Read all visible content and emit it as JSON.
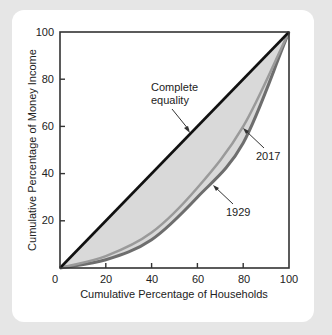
{
  "chart_data": {
    "type": "line",
    "title": "",
    "xlabel": "Cumulative Percentage of Households",
    "ylabel": "Cumulative Percentage of Money Income",
    "xlim": [
      0,
      100
    ],
    "ylim": [
      0,
      100
    ],
    "x_ticks": [
      0,
      20,
      40,
      60,
      80,
      100
    ],
    "y_ticks": [
      20,
      40,
      60,
      80,
      100
    ],
    "x_tick_labels": [
      "0",
      "20",
      "40",
      "60",
      "80",
      "100"
    ],
    "y_tick_labels": [
      "20",
      "40",
      "60",
      "80",
      "100"
    ],
    "grid": false,
    "x": [
      0,
      20,
      40,
      60,
      80,
      100
    ],
    "series": [
      {
        "name": "Complete equality",
        "values": [
          0,
          20,
          40,
          60,
          80,
          100
        ],
        "color": "#111111"
      },
      {
        "name": "2017",
        "values": [
          0,
          5,
          15,
          34,
          60,
          100
        ],
        "color": "#9a9a9a"
      },
      {
        "name": "1929",
        "values": [
          0,
          3.5,
          12,
          30,
          53,
          100
        ],
        "color": "#6e6e6e"
      }
    ],
    "annotations": [
      {
        "text_lines": [
          "Complete",
          "equality"
        ],
        "points_to": "Complete equality"
      },
      {
        "text": "2017",
        "points_to": "2017"
      },
      {
        "text": "1929",
        "points_to": "1929"
      }
    ],
    "fill": {
      "between": [
        "Complete equality",
        "1929"
      ],
      "color": "#d9d9d9"
    }
  },
  "labels": {
    "ylabel": "Cumulative Percentage of Money Income",
    "xlabel": "Cumulative Percentage of Households",
    "equality_line1": "Complete",
    "equality_line2": "equality",
    "label_2017": "2017",
    "label_1929": "1929",
    "x0": "0",
    "x20": "20",
    "x40": "40",
    "x60": "60",
    "x80": "80",
    "x100": "100",
    "y20": "20",
    "y40": "40",
    "y60": "60",
    "y80": "80",
    "y100": "100"
  }
}
